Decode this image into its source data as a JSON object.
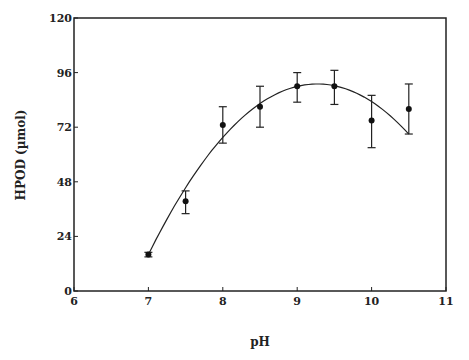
{
  "chart_data": {
    "type": "scatter",
    "title": "",
    "xlabel": "pH",
    "ylabel": "HPOD (µmol)",
    "xlim": [
      6,
      11
    ],
    "ylim": [
      0,
      120
    ],
    "x_ticks": [
      "6",
      "7",
      "8",
      "9",
      "10",
      "11"
    ],
    "y_ticks": [
      "0",
      "24",
      "48",
      "72",
      "96",
      "120"
    ],
    "grid": false,
    "legend": null,
    "series": [
      {
        "name": "HPOD",
        "x": [
          7,
          7.5,
          8,
          8.5,
          9,
          9.5,
          10,
          10.5
        ],
        "y": [
          16,
          39.5,
          73,
          81,
          90,
          90,
          75,
          80
        ],
        "error_low": [
          15,
          34,
          65,
          72,
          83,
          82,
          63,
          69
        ],
        "error_high": [
          17,
          44,
          81,
          90,
          96,
          97,
          86,
          91
        ]
      },
      {
        "name": "fit",
        "type": "line",
        "x": [
          7,
          7.5,
          8,
          8.5,
          9,
          9.27,
          9.5,
          10,
          10.5
        ],
        "y": [
          16,
          45,
          67,
          82,
          89.5,
          91,
          90,
          85,
          77
        ]
      }
    ]
  }
}
